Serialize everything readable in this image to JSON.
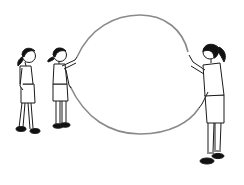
{
  "illustration": {
    "description": "Line drawing of three girls playing jump rope: two girls on the left (one waiting, one holding a rope end), one girl on the right holding the other end, rope forming a large loop between them",
    "style": "black-and-white line art",
    "colors": {
      "background": "#ffffff",
      "ink": "#1a1a1a",
      "rope": "#8a8a8a",
      "fill": "#ffffff",
      "hair": "#111111"
    },
    "figures": [
      {
        "id": "girl-waiting",
        "position": "far-left",
        "pose": "standing, walking, arms at sides"
      },
      {
        "id": "girl-holding-left",
        "position": "left",
        "pose": "holding rope with both hands, one raised"
      },
      {
        "id": "girl-holding-right",
        "position": "right",
        "pose": "holding rope with both hands, one raised, ponytail"
      }
    ],
    "rope": {
      "shape": "large loop between two holders"
    }
  }
}
